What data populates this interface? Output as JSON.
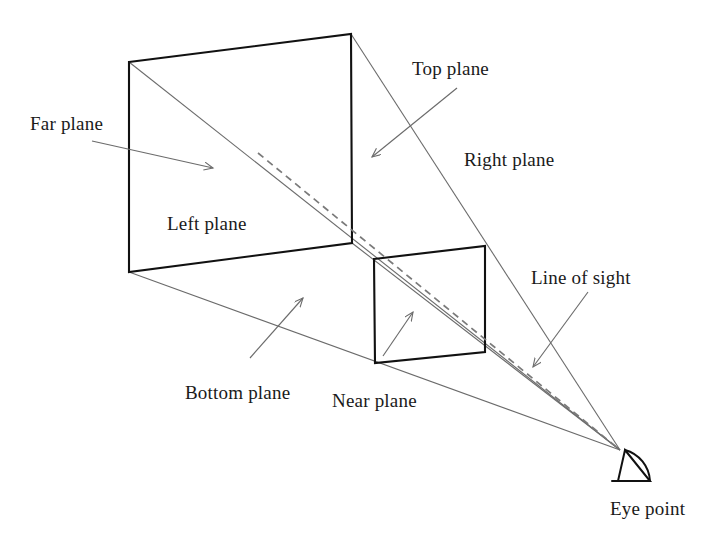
{
  "figure": {
    "type": "diagram",
    "background_color": "#ffffff",
    "stroke_colors": {
      "solid_plane_edge": "#111111",
      "frustum_ray": "#6b6b6b",
      "leader_arrow": "#6b6b6b",
      "line_of_sight_dashed": "#7a7a7a",
      "text": "#1a1a1a"
    },
    "labels": [
      {
        "id": "far-plane",
        "text": "Far plane",
        "x": 30,
        "y": 113
      },
      {
        "id": "left-plane",
        "text": "Left plane",
        "x": 167,
        "y": 213
      },
      {
        "id": "top-plane",
        "text": "Top plane",
        "x": 412,
        "y": 58
      },
      {
        "id": "right-plane",
        "text": "Right plane",
        "x": 464,
        "y": 149
      },
      {
        "id": "line-of-sight",
        "text": "Line of sight",
        "x": 531,
        "y": 267
      },
      {
        "id": "bottom-plane",
        "text": "Bottom plane",
        "x": 185,
        "y": 382
      },
      {
        "id": "near-plane",
        "text": "Near plane",
        "x": 332,
        "y": 390
      },
      {
        "id": "eye-point",
        "text": "Eye point",
        "x": 610,
        "y": 498
      }
    ],
    "geometry": {
      "far_plane_corners": [
        [
          129,
          62
        ],
        [
          351,
          34
        ],
        [
          352,
          243
        ],
        [
          129,
          272
        ]
      ],
      "near_plane_corners": [
        [
          374,
          259
        ],
        [
          485,
          246
        ],
        [
          485,
          352
        ],
        [
          375,
          363
        ]
      ],
      "eye_point": [
        620,
        450
      ],
      "line_of_sight_start": [
        258,
        153
      ],
      "diagonal_start": [
        129,
        62
      ]
    },
    "leader_arrows": [
      {
        "id": "far-plane-arrow",
        "from": [
          92,
          141
        ],
        "to": [
          213,
          168
        ]
      },
      {
        "id": "top-plane-arrow",
        "from": [
          457,
          88
        ],
        "to": [
          372,
          157
        ]
      },
      {
        "id": "line-of-sight-arrow",
        "from": [
          588,
          292
        ],
        "to": [
          533,
          367
        ]
      },
      {
        "id": "bottom-plane-arrow",
        "from": [
          250,
          358
        ],
        "to": [
          303,
          298
        ]
      },
      {
        "id": "near-plane-arrow",
        "from": [
          383,
          356
        ],
        "to": [
          413,
          312
        ]
      }
    ]
  }
}
